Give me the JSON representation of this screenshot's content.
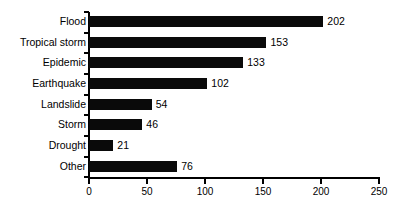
{
  "chart_data": {
    "type": "bar",
    "orientation": "horizontal",
    "title": "",
    "subtitle": "",
    "xlabel": "",
    "ylabel": "",
    "categories": [
      "Flood",
      "Tropical storm",
      "Epidemic",
      "Earthquake",
      "Landslide",
      "Storm",
      "Drought",
      "Other"
    ],
    "values": [
      202,
      153,
      133,
      102,
      54,
      46,
      21,
      76
    ],
    "data_labels": [
      "202",
      "153",
      "133",
      "102",
      "54",
      "46",
      "21",
      "76"
    ],
    "xlim": [
      0,
      250
    ],
    "xticks": [
      0,
      50,
      100,
      150,
      200,
      250
    ],
    "xtick_labels": [
      "0",
      "50",
      "100",
      "150",
      "200",
      "250"
    ],
    "grid": false,
    "legend": false,
    "bar_color": "#0a0a0a",
    "axis_color": "#000000",
    "background": "#ffffff"
  }
}
